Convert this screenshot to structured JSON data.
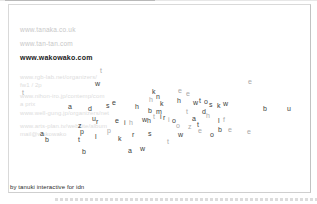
{
  "colors": {
    "background": "#ffffff",
    "frame_border": "#d9d9d9",
    "link_muted": "#c7c7c7",
    "link_active": "#191919",
    "letter_dark": "#3c3c3c",
    "letter_light": "#a9a9a9"
  },
  "links": {
    "items": [
      {
        "label": "www.tanaka.co.uk",
        "active": false
      },
      {
        "label": "www.tan-tan.com",
        "active": false
      },
      {
        "label": "www.wakowako.com",
        "active": true
      }
    ]
  },
  "faint_links": [
    {
      "x": 20,
      "y": 74,
      "text": "www.rgb-lab.net/organizers/"
    },
    {
      "x": 20,
      "y": 82,
      "text": "fw1 / 2p"
    },
    {
      "x": 20,
      "y": 93,
      "text": "www.nihon-iro.jp/contemp/com"
    },
    {
      "x": 20,
      "y": 101,
      "text": "a prix"
    },
    {
      "x": 20,
      "y": 110,
      "text": "www.well-gung.jp/organizers/net"
    },
    {
      "x": 20,
      "y": 123,
      "text": "www.arts-plan.tv/website/album"
    },
    {
      "x": 20,
      "y": 131,
      "text": "mail@wakowako"
    }
  ],
  "credit": "by tanuki interactive for idn",
  "letters": [
    {
      "c": "t",
      "x": 100,
      "y": 67,
      "t": "l"
    },
    {
      "c": "w",
      "x": 95,
      "y": 80,
      "t": "d"
    },
    {
      "c": "e",
      "x": 248,
      "y": 78,
      "t": "l"
    },
    {
      "c": "t",
      "x": 22,
      "y": 89,
      "t": "l"
    },
    {
      "c": "a",
      "x": 68,
      "y": 103,
      "t": "d"
    },
    {
      "c": "d",
      "x": 88,
      "y": 105,
      "t": "d"
    },
    {
      "c": "s",
      "x": 106,
      "y": 102,
      "t": "d"
    },
    {
      "c": "e",
      "x": 112,
      "y": 99,
      "t": "d"
    },
    {
      "c": "h",
      "x": 135,
      "y": 103,
      "t": "d"
    },
    {
      "c": "k",
      "x": 152,
      "y": 88,
      "t": "d"
    },
    {
      "c": "h",
      "x": 149,
      "y": 96,
      "t": "l"
    },
    {
      "c": "n",
      "x": 156,
      "y": 93,
      "t": "d"
    },
    {
      "c": "k",
      "x": 160,
      "y": 100,
      "t": "d"
    },
    {
      "c": "e",
      "x": 178,
      "y": 87,
      "t": "l"
    },
    {
      "c": "h",
      "x": 177,
      "y": 97,
      "t": "d"
    },
    {
      "c": "e",
      "x": 186,
      "y": 90,
      "t": "l"
    },
    {
      "c": "w",
      "x": 193,
      "y": 99,
      "t": "d"
    },
    {
      "c": "t",
      "x": 199,
      "y": 97,
      "t": "d"
    },
    {
      "c": "o",
      "x": 204,
      "y": 98,
      "t": "d"
    },
    {
      "c": "s",
      "x": 209,
      "y": 101,
      "t": "d"
    },
    {
      "c": "k",
      "x": 217,
      "y": 102,
      "t": "d"
    },
    {
      "c": "w",
      "x": 223,
      "y": 100,
      "t": "d"
    },
    {
      "c": "b",
      "x": 263,
      "y": 105,
      "t": "d"
    },
    {
      "c": "u",
      "x": 287,
      "y": 105,
      "t": "d"
    },
    {
      "c": "b",
      "x": 148,
      "y": 107,
      "t": "d"
    },
    {
      "c": "m",
      "x": 156,
      "y": 108,
      "t": "d"
    },
    {
      "c": "t",
      "x": 153,
      "y": 113,
      "t": "l"
    },
    {
      "c": "i",
      "x": 160,
      "y": 113,
      "t": "d"
    },
    {
      "c": "w",
      "x": 142,
      "y": 116,
      "t": "d"
    },
    {
      "c": "h",
      "x": 147,
      "y": 117,
      "t": "d"
    },
    {
      "c": "r",
      "x": 163,
      "y": 114,
      "t": "d"
    },
    {
      "c": "i",
      "x": 168,
      "y": 116,
      "t": "l"
    },
    {
      "c": "o",
      "x": 172,
      "y": 117,
      "t": "d"
    },
    {
      "c": "o",
      "x": 176,
      "y": 122,
      "t": "l"
    },
    {
      "c": "t",
      "x": 186,
      "y": 108,
      "t": "l"
    },
    {
      "c": "d",
      "x": 202,
      "y": 108,
      "t": "d"
    },
    {
      "c": "h",
      "x": 206,
      "y": 112,
      "t": "l"
    },
    {
      "c": "a",
      "x": 192,
      "y": 115,
      "t": "d"
    },
    {
      "c": "t",
      "x": 197,
      "y": 121,
      "t": "d"
    },
    {
      "c": "z",
      "x": 188,
      "y": 123,
      "t": "l"
    },
    {
      "c": "l",
      "x": 218,
      "y": 117,
      "t": "d"
    },
    {
      "c": "f",
      "x": 223,
      "y": 116,
      "t": "l"
    },
    {
      "c": "b",
      "x": 218,
      "y": 126,
      "t": "d"
    },
    {
      "c": "e",
      "x": 228,
      "y": 126,
      "t": "l"
    },
    {
      "c": "o",
      "x": 210,
      "y": 131,
      "t": "d"
    },
    {
      "c": "e",
      "x": 247,
      "y": 128,
      "t": "l"
    },
    {
      "c": "u",
      "x": 92,
      "y": 115,
      "t": "d"
    },
    {
      "c": "r",
      "x": 96,
      "y": 118,
      "t": "d"
    },
    {
      "c": "e",
      "x": 115,
      "y": 117,
      "t": "d"
    },
    {
      "c": "i",
      "x": 124,
      "y": 119,
      "t": "d"
    },
    {
      "c": "h",
      "x": 129,
      "y": 119,
      "t": "l"
    },
    {
      "c": "z",
      "x": 78,
      "y": 122,
      "t": "d"
    },
    {
      "c": "p",
      "x": 80,
      "y": 128,
      "t": "d"
    },
    {
      "c": "p",
      "x": 107,
      "y": 127,
      "t": "l"
    },
    {
      "c": "t",
      "x": 78,
      "y": 136,
      "t": "d"
    },
    {
      "c": "l",
      "x": 95,
      "y": 133,
      "t": "d"
    },
    {
      "c": "k",
      "x": 118,
      "y": 135,
      "t": "d"
    },
    {
      "c": "r",
      "x": 132,
      "y": 131,
      "t": "d"
    },
    {
      "c": "s",
      "x": 148,
      "y": 130,
      "t": "d"
    },
    {
      "c": "w",
      "x": 178,
      "y": 131,
      "t": "d"
    },
    {
      "c": "e",
      "x": 198,
      "y": 127,
      "t": "l"
    },
    {
      "c": "t",
      "x": 167,
      "y": 138,
      "t": "l"
    },
    {
      "c": "b",
      "x": 82,
      "y": 148,
      "t": "d"
    },
    {
      "c": "a",
      "x": 128,
      "y": 147,
      "t": "d"
    },
    {
      "c": "w",
      "x": 140,
      "y": 145,
      "t": "d"
    },
    {
      "c": "a",
      "x": 40,
      "y": 130,
      "t": "d"
    },
    {
      "c": "b",
      "x": 45,
      "y": 136,
      "t": "d"
    }
  ]
}
